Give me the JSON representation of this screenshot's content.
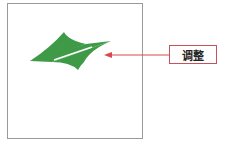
{
  "diagram": {
    "shape": {
      "name": "green-skewed-four-point-shape",
      "color": "#3f9a48"
    },
    "arrow": {
      "color": "#d9484e"
    },
    "label": {
      "text": "调整",
      "border_color": "#c9525a"
    },
    "frame": {
      "border_color": "#9a9a9a"
    }
  }
}
